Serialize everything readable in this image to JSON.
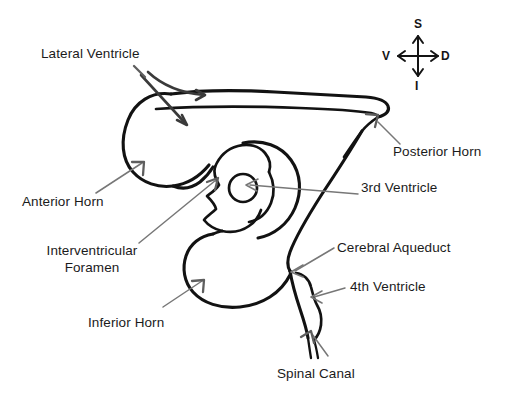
{
  "diagram": {
    "background_color": "#ffffff",
    "outline_color": "#121212",
    "pointer_color": "#5e5e5e",
    "leader_color": "#777777",
    "text_color": "#1b1b1b"
  },
  "labels": {
    "lateral_ventricle": "Lateral Ventricle",
    "posterior_horn": "Posterior Horn",
    "anterior_horn": "Anterior Horn",
    "third_ventricle": "3rd Ventricle",
    "interventricular_foramen_line1": "Interventricular",
    "interventricular_foramen_line2": "Foramen",
    "cerebral_aqueduct": "Cerebral Aqueduct",
    "fourth_ventricle": "4th Ventricle",
    "inferior_horn": "Inferior Horn",
    "spinal_canal": "Spinal Canal"
  },
  "compass": {
    "superior": "S",
    "inferior": "I",
    "ventral": "V",
    "dorsal": "D"
  }
}
